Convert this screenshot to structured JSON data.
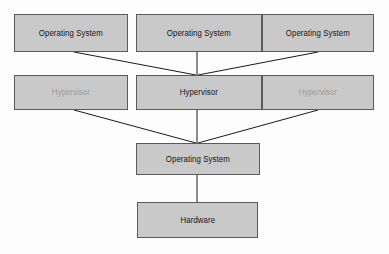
{
  "diagram": {
    "type": "block-diagram",
    "background_color": "#fdfdfd",
    "node_fill_color": "#c9c9c9",
    "node_border_color": "#5a5a5a",
    "active_text_color": "#141414",
    "inactive_text_color": "#9b9b9b",
    "connector_color": "#1a1a1a",
    "nodes": [
      {
        "id": "guest-os-left",
        "label": "Operating System",
        "state": "active",
        "x": 14,
        "y": 14,
        "w": 114,
        "h": 38
      },
      {
        "id": "guest-os-center",
        "label": "Operating System",
        "state": "active",
        "x": 136,
        "y": 14,
        "w": 126,
        "h": 38
      },
      {
        "id": "guest-os-right",
        "label": "Operating System",
        "state": "active",
        "x": 262,
        "y": 14,
        "w": 112,
        "h": 38
      },
      {
        "id": "hypervisor-left",
        "label": "Hypervisor",
        "state": "inactive",
        "x": 14,
        "y": 75,
        "w": 114,
        "h": 35
      },
      {
        "id": "hypervisor-center",
        "label": "Hypervisor",
        "state": "active",
        "x": 136,
        "y": 75,
        "w": 126,
        "h": 35
      },
      {
        "id": "hypervisor-right",
        "label": "Hypervisor",
        "state": "inactive",
        "x": 262,
        "y": 75,
        "w": 112,
        "h": 35
      },
      {
        "id": "host-os",
        "label": "Operating System",
        "state": "active",
        "x": 136,
        "y": 143,
        "w": 124,
        "h": 32
      },
      {
        "id": "hardware",
        "label": "Hardware",
        "state": "active",
        "x": 137,
        "y": 202,
        "w": 121,
        "h": 36
      }
    ],
    "connectors": [
      {
        "id": "guest-os-left-to-hypervisor-center",
        "from": "guest-os-left",
        "to": "hypervisor-center",
        "x1": 74,
        "y1": 52,
        "x2": 196,
        "y2": 75
      },
      {
        "id": "guest-os-center-to-hypervisor-center",
        "from": "guest-os-center",
        "to": "hypervisor-center",
        "x1": 197,
        "y1": 52,
        "x2": 197,
        "y2": 75
      },
      {
        "id": "guest-os-right-to-hypervisor-center",
        "from": "guest-os-right",
        "to": "hypervisor-center",
        "x1": 318,
        "y1": 52,
        "x2": 198,
        "y2": 75
      },
      {
        "id": "hypervisor-left-to-host-os",
        "from": "hypervisor-left",
        "to": "host-os",
        "x1": 74,
        "y1": 110,
        "x2": 196,
        "y2": 143
      },
      {
        "id": "hypervisor-center-to-host-os",
        "from": "hypervisor-center",
        "to": "host-os",
        "x1": 197,
        "y1": 110,
        "x2": 197,
        "y2": 143
      },
      {
        "id": "hypervisor-right-to-host-os",
        "from": "hypervisor-right",
        "to": "host-os",
        "x1": 318,
        "y1": 110,
        "x2": 198,
        "y2": 143
      },
      {
        "id": "host-os-to-hardware",
        "from": "host-os",
        "to": "hardware",
        "x1": 197,
        "y1": 175,
        "x2": 197,
        "y2": 202
      }
    ]
  }
}
